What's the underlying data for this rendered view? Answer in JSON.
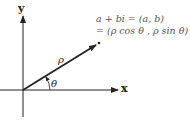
{
  "diagram": {
    "axes": {
      "x_label": "x",
      "y_label": "y"
    },
    "vector": {
      "magnitude_label": "ρ",
      "angle_label": "θ"
    },
    "formula": {
      "line1": "a + bi = (a, b)",
      "line2": "= (ρ cos θ , ρ sin θ)"
    },
    "colors": {
      "ink": "#222222",
      "formula_text": "#555555",
      "background": "#ffffff"
    }
  }
}
